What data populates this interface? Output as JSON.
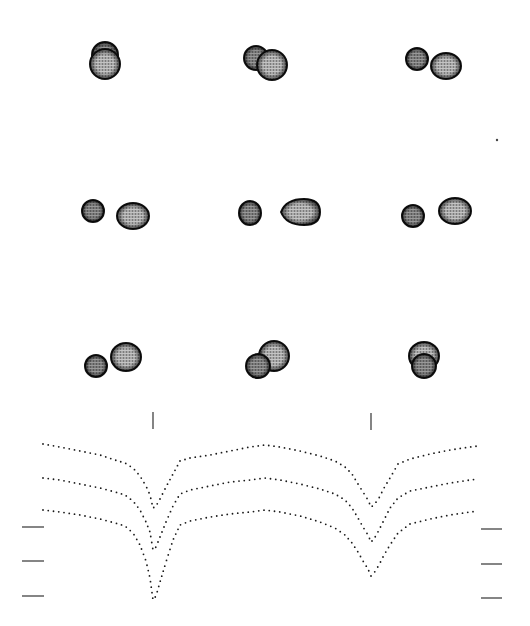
{
  "figure": {
    "background": "#ffffff",
    "ink": "#1a1a1a",
    "star_fill_primary": "#9a9a9a",
    "star_fill_secondary": "#6e6e6e",
    "star_outline": "#111111"
  },
  "panels": [
    {
      "row": 0,
      "col": 0,
      "cx": 105,
      "cy": 62,
      "stars": [
        {
          "role": "secondary",
          "dx": 0,
          "dy": -7,
          "rx": 13,
          "ry": 13,
          "behind": true
        },
        {
          "role": "primary",
          "dx": 0,
          "dy": 2,
          "rx": 15,
          "ry": 15,
          "behind": false
        }
      ]
    },
    {
      "row": 0,
      "col": 1,
      "cx": 264,
      "cy": 62,
      "stars": [
        {
          "role": "secondary",
          "dx": -8,
          "dy": -4,
          "rx": 12,
          "ry": 12,
          "behind": true
        },
        {
          "role": "primary",
          "dx": 8,
          "dy": 3,
          "rx": 15,
          "ry": 15,
          "behind": false
        }
      ]
    },
    {
      "row": 0,
      "col": 2,
      "cx": 432,
      "cy": 63,
      "stars": [
        {
          "role": "secondary",
          "dx": -15,
          "dy": -4,
          "rx": 11,
          "ry": 11,
          "behind": false
        },
        {
          "role": "primary",
          "dx": 14,
          "dy": 3,
          "rx": 15,
          "ry": 13,
          "behind": false
        }
      ]
    },
    {
      "row": 1,
      "col": 0,
      "cx": 112,
      "cy": 213,
      "stars": [
        {
          "role": "secondary",
          "dx": -19,
          "dy": -2,
          "rx": 11,
          "ry": 11,
          "behind": false
        },
        {
          "role": "primary",
          "dx": 21,
          "dy": 3,
          "rx": 16,
          "ry": 13,
          "behind": false
        }
      ]
    },
    {
      "row": 1,
      "col": 1,
      "cx": 275,
      "cy": 213,
      "stars": [
        {
          "role": "secondary",
          "dx": -25,
          "dy": 0,
          "rx": 11,
          "ry": 12,
          "behind": false
        },
        {
          "role": "primary",
          "dx": 27,
          "dy": -1,
          "rx": 18,
          "ry": 13,
          "behind": false,
          "teardrop": true
        }
      ]
    },
    {
      "row": 1,
      "col": 2,
      "cx": 438,
      "cy": 213,
      "stars": [
        {
          "role": "secondary",
          "dx": -25,
          "dy": 3,
          "rx": 11,
          "ry": 11,
          "behind": false
        },
        {
          "role": "primary",
          "dx": 17,
          "dy": -2,
          "rx": 16,
          "ry": 13,
          "behind": false
        }
      ]
    },
    {
      "row": 2,
      "col": 0,
      "cx": 111,
      "cy": 362,
      "stars": [
        {
          "role": "primary",
          "dx": 15,
          "dy": -5,
          "rx": 15,
          "ry": 14,
          "behind": true
        },
        {
          "role": "secondary",
          "dx": -15,
          "dy": 4,
          "rx": 11,
          "ry": 11,
          "behind": false
        }
      ]
    },
    {
      "row": 2,
      "col": 1,
      "cx": 266,
      "cy": 360,
      "stars": [
        {
          "role": "primary",
          "dx": 8,
          "dy": -4,
          "rx": 15,
          "ry": 15,
          "behind": true
        },
        {
          "role": "secondary",
          "dx": -8,
          "dy": 6,
          "rx": 12,
          "ry": 12,
          "behind": false
        }
      ]
    },
    {
      "row": 2,
      "col": 2,
      "cx": 424,
      "cy": 362,
      "stars": [
        {
          "role": "primary",
          "dx": 0,
          "dy": -6,
          "rx": 15,
          "ry": 14,
          "behind": true
        },
        {
          "role": "secondary",
          "dx": 0,
          "dy": 4,
          "rx": 12,
          "ry": 12,
          "behind": false
        }
      ]
    }
  ],
  "stray_dot": {
    "x": 497,
    "y": 140
  },
  "phase_markers": [
    {
      "x": 153,
      "y1": 412,
      "y2": 429
    },
    {
      "x": 371,
      "y1": 413,
      "y2": 430
    }
  ],
  "scale_bars_left": [
    {
      "x1": 22,
      "x2": 44,
      "y": 527
    },
    {
      "x1": 22,
      "x2": 44,
      "y": 561
    },
    {
      "x1": 22,
      "x2": 44,
      "y": 596
    }
  ],
  "scale_bars_right": [
    {
      "x1": 481,
      "x2": 502,
      "y": 529
    },
    {
      "x1": 481,
      "x2": 502,
      "y": 564
    },
    {
      "x1": 481,
      "x2": 502,
      "y": 598
    }
  ],
  "chart_data": {
    "type": "scatter",
    "title": "",
    "xlabel": "",
    "ylabel": "",
    "grid": false,
    "legend": "none",
    "note": "Three vertically offset dotted light curves (relative flux vs orbital phase); y in screen pixels, lower = brighter",
    "x_px_range": [
      43,
      478
    ],
    "x": [
      43,
      60,
      80,
      100,
      115,
      125,
      133,
      140,
      146,
      150,
      153,
      156,
      160,
      166,
      173,
      180,
      190,
      210,
      230,
      250,
      265,
      280,
      300,
      320,
      335,
      345,
      352,
      358,
      363,
      368,
      371,
      374,
      379,
      384,
      390,
      398,
      410,
      430,
      450,
      470,
      478
    ],
    "series": [
      {
        "name": "curve-1",
        "y": [
          444,
          447,
          451,
          455,
          460,
          463,
          468,
          476,
          486,
          495,
          508,
          506,
          499,
          487,
          474,
          461,
          458,
          455,
          451,
          447,
          445,
          447,
          451,
          456,
          461,
          467,
          474,
          484,
          492,
          500,
          507,
          505,
          498,
          488,
          478,
          464,
          459,
          454,
          450,
          447,
          446
        ]
      },
      {
        "name": "curve-2",
        "y": [
          478,
          480,
          484,
          488,
          492,
          495,
          501,
          510,
          522,
          532,
          550,
          547,
          537,
          522,
          506,
          494,
          490,
          486,
          482,
          480,
          478,
          480,
          484,
          489,
          494,
          500,
          508,
          518,
          527,
          535,
          542,
          539,
          530,
          520,
          508,
          498,
          491,
          487,
          483,
          480,
          479
        ]
      },
      {
        "name": "curve-3",
        "y": [
          510,
          512,
          515,
          519,
          523,
          526,
          533,
          545,
          561,
          578,
          600,
          596,
          582,
          562,
          540,
          525,
          521,
          517,
          514,
          512,
          510,
          512,
          516,
          522,
          528,
          535,
          543,
          552,
          561,
          569,
          576,
          573,
          565,
          555,
          545,
          533,
          524,
          519,
          515,
          512,
          511
        ]
      }
    ]
  }
}
